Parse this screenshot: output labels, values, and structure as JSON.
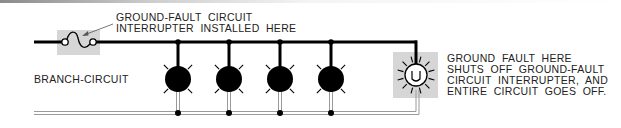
{
  "labels": {
    "gfci_line1": "GROUND-FAULT  CIRCUIT",
    "gfci_line2": "INTERRUPTER  INSTALLED  HERE",
    "branch": "BRANCH-CIRCUIT",
    "fault_line1": "GROUND  FAULT  HERE",
    "fault_line2": "SHUTS  OFF  GROUND-FAULT",
    "fault_line3": "CIRCUIT  INTERRUPTER,  AND",
    "fault_line4": "ENTIRE  CIRCUIT  GOES  OFF."
  },
  "components": {
    "gfci": {
      "type": "ground-fault-circuit-interrupter"
    },
    "lamps": [
      {
        "id": 1,
        "state": "off"
      },
      {
        "id": 2,
        "state": "off"
      },
      {
        "id": 3,
        "state": "off"
      },
      {
        "id": 4,
        "state": "off"
      }
    ],
    "fault_lamp": {
      "state": "fault"
    }
  },
  "colors": {
    "wire": "#000000",
    "neutral": "#999999",
    "highlight": "#d6d6d6"
  }
}
